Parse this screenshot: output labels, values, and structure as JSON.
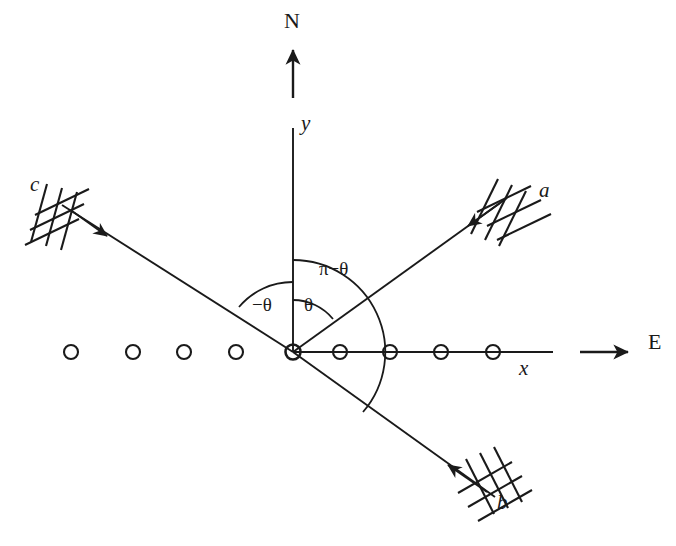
{
  "figure": {
    "background_color": "#ffffff",
    "stroke_color": "#1a1a1a",
    "width": 676,
    "height": 546
  },
  "origin": {
    "x": 293,
    "y": 352
  },
  "axes": {
    "y_axis": {
      "label": "y",
      "label_x": 301,
      "label_y": 122,
      "top_y": 128,
      "bottom_y": 352
    },
    "x_axis": {
      "label": "x",
      "label_x": 519,
      "label_y": 366,
      "left_x": 293,
      "right_x": 553
    }
  },
  "compass": {
    "north": {
      "label": "N",
      "label_x": 284,
      "label_y": 22,
      "arrow_from_y": 96,
      "arrow_to_y": 46
    },
    "east": {
      "label": "E",
      "label_x": 648,
      "label_y": 340,
      "arrow_from_x": 580,
      "arrow_to_x": 630,
      "arrow_y": 352
    }
  },
  "rays": [
    {
      "name": "a",
      "label": "a",
      "label_x": 539,
      "label_y": 188,
      "direction_deg": 40,
      "tip_x": 505,
      "tip_y": 200,
      "arrow_x": 472,
      "arrow_y": 228,
      "arrow_direction": "toward-origin",
      "hatch_count": 3
    },
    {
      "name": "b",
      "label": "b",
      "label_x": 497,
      "label_y": 500,
      "direction_deg": -40,
      "tip_x": 490,
      "tip_y": 493,
      "arrow_x": 452,
      "arrow_y": 477,
      "arrow_direction": "toward-origin",
      "hatch_count": 3
    },
    {
      "name": "c",
      "label": "c",
      "label_x": 30,
      "label_y": 182,
      "direction_deg": 140,
      "tip_x": 62,
      "tip_y": 205,
      "arrow_x": 103,
      "arrow_y": 233,
      "arrow_direction": "away-from-origin",
      "hatch_count": 3
    }
  ],
  "angles": [
    {
      "name": "theta",
      "label": "θ",
      "label_x": 306,
      "label_y": 305,
      "radius": 52,
      "from_deg": 40,
      "to_deg": 90
    },
    {
      "name": "minus-theta",
      "label": "−θ",
      "label_x": 257,
      "label_y": 305,
      "radius": 70,
      "from_deg": 90,
      "to_deg": 140
    },
    {
      "name": "pi-minus-theta",
      "label": "π−θ",
      "label_x": 323,
      "label_y": 270,
      "radius": 92,
      "from_deg": -40,
      "to_deg": 90
    }
  ],
  "scatterers": {
    "description": "row of open circles along the x direction",
    "radius": 7,
    "y": 352,
    "left_x_positions": [
      71,
      133,
      184,
      236
    ],
    "right_x_positions": [
      340,
      390,
      441,
      493
    ]
  }
}
